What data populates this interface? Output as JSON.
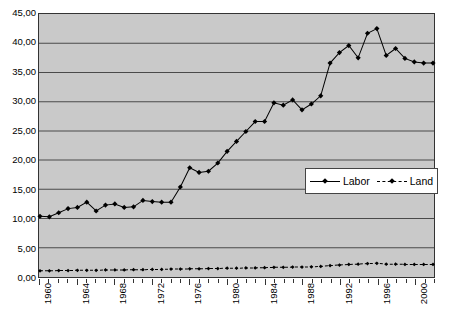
{
  "chart_data": {
    "type": "line",
    "title": "",
    "subtitle": "",
    "xlabel": "",
    "ylabel": "",
    "ylim": [
      0,
      45
    ],
    "ytick_step": 5,
    "ytick_labels": [
      "0,00",
      "5,00",
      "10,00",
      "15,00",
      "20,00",
      "25,00",
      "30,00",
      "35,00",
      "40,00",
      "45,00"
    ],
    "grid": true,
    "grid_axis": "y",
    "legend_position": "inside-right-middle",
    "decimal_separator": ",",
    "x": [
      1960,
      1961,
      1962,
      1963,
      1964,
      1965,
      1966,
      1967,
      1968,
      1969,
      1970,
      1971,
      1972,
      1973,
      1974,
      1975,
      1976,
      1977,
      1978,
      1979,
      1980,
      1981,
      1982,
      1983,
      1984,
      1985,
      1986,
      1987,
      1988,
      1989,
      1990,
      1991,
      1992,
      1993,
      1994,
      1995,
      1996,
      1997,
      1998,
      1999,
      2000,
      2001,
      2002
    ],
    "xtick_labels": [
      "1960",
      "1964",
      "1968",
      "1972",
      "1976",
      "1980",
      "1984",
      "1988",
      "1992",
      "1996",
      "2000"
    ],
    "xtick_every": 4,
    "series": [
      {
        "name": "Labor",
        "style": "solid",
        "marker": "diamond",
        "color": "#000000",
        "values": [
          10.4,
          10.3,
          11.0,
          11.7,
          11.9,
          12.8,
          11.3,
          12.3,
          12.5,
          11.9,
          12.0,
          13.1,
          12.9,
          12.8,
          12.8,
          15.4,
          18.7,
          17.9,
          18.1,
          19.5,
          21.5,
          23.2,
          24.9,
          26.6,
          26.6,
          29.8,
          29.4,
          30.3,
          28.6,
          29.6,
          31.0,
          36.6,
          38.4,
          39.6,
          37.5,
          41.7,
          42.5,
          37.9,
          39.1,
          37.4,
          36.8,
          36.6,
          36.6
        ]
      },
      {
        "name": "Land",
        "style": "dashed",
        "marker": "diamond",
        "color": "#000000",
        "values": [
          1.05,
          1.05,
          1.1,
          1.1,
          1.15,
          1.15,
          1.15,
          1.2,
          1.2,
          1.2,
          1.25,
          1.25,
          1.3,
          1.3,
          1.35,
          1.35,
          1.4,
          1.4,
          1.45,
          1.45,
          1.5,
          1.5,
          1.55,
          1.55,
          1.6,
          1.65,
          1.65,
          1.7,
          1.7,
          1.75,
          1.8,
          1.95,
          2.05,
          2.15,
          2.2,
          2.3,
          2.35,
          2.2,
          2.2,
          2.15,
          2.15,
          2.15,
          2.15
        ]
      }
    ]
  },
  "legend": {
    "entries": [
      {
        "label": "Labor"
      },
      {
        "label": "Land"
      }
    ]
  },
  "colors": {
    "plot_background": "#c9c9c9",
    "gridline": "#4a4a4a",
    "frame": "#333333",
    "series": "#000000",
    "legend_background": "#ffffff",
    "page_background": "#ffffff"
  }
}
